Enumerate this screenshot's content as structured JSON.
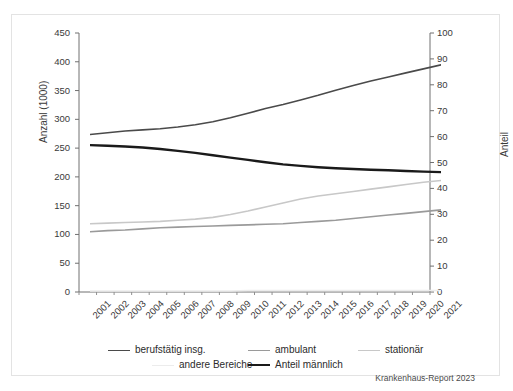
{
  "credit": "Krankenhaus-Report 2023",
  "axes": {
    "left_title": "Anzahl (1000)",
    "right_title": "Anteil",
    "left_ticks": [
      "450",
      "400",
      "350",
      "300",
      "250",
      "200",
      "150",
      "100",
      "50",
      "0"
    ],
    "right_ticks": [
      "100",
      "90",
      "80",
      "70",
      "60",
      "50",
      "40",
      "30",
      "20",
      "10",
      "0"
    ]
  },
  "legend": {
    "rows": [
      [
        {
          "label": "berufstätig insg.",
          "color": "#4a4a4a",
          "width": 1.6
        },
        {
          "label": "ambulant",
          "color": "#9a9a9a",
          "width": 1.6
        },
        {
          "label": "stationär",
          "color": "#c8c8c8",
          "width": 1.6
        }
      ],
      [
        {
          "label": "andere Bereiche",
          "color": "#ececec",
          "width": 1.6
        },
        {
          "label": "Anteil männlich",
          "color": "#1a1a1a",
          "width": 2.4
        }
      ]
    ]
  },
  "chart_data": {
    "type": "line",
    "title": "",
    "xlabel": "",
    "ylabel": "Anzahl (1000)",
    "y2label": "Anteil",
    "ylim": [
      0,
      450
    ],
    "y2lim": [
      0,
      100
    ],
    "grid": false,
    "legend_position": "bottom",
    "categories": [
      "2001",
      "2002",
      "2003",
      "2004",
      "2005",
      "2006",
      "2007",
      "2008",
      "2009",
      "2010",
      "2011",
      "2012",
      "2013",
      "2014",
      "2015",
      "2016",
      "2017",
      "2018",
      "2019",
      "2020",
      "2021"
    ],
    "series": [
      {
        "name": "berufstätig insg.",
        "axis": "left",
        "color": "#4a4a4a",
        "width": 1.6,
        "values": [
          298,
          301,
          304,
          306,
          308,
          311,
          315,
          320,
          327,
          335,
          343,
          350,
          358,
          366,
          375,
          383,
          391,
          398,
          405,
          412,
          419
        ]
      },
      {
        "name": "ambulant",
        "axis": "left",
        "color": "#9a9a9a",
        "width": 1.6,
        "values": [
          129,
          131,
          132,
          134,
          136,
          137,
          138,
          139,
          140,
          141,
          142,
          143,
          145,
          147,
          149,
          152,
          155,
          158,
          161,
          164,
          167
        ]
      },
      {
        "name": "stationär",
        "axis": "left",
        "color": "#c8c8c8",
        "width": 1.6,
        "values": [
          143,
          144,
          145,
          146,
          147,
          149,
          151,
          154,
          159,
          165,
          172,
          179,
          186,
          191,
          195,
          199,
          203,
          207,
          211,
          215,
          218
        ]
      },
      {
        "name": "andere Bereiche",
        "axis": "left",
        "color": "#ececec",
        "width": 1.6,
        "values": [
          26,
          26,
          26,
          26,
          26,
          26,
          26,
          26,
          26,
          27,
          27,
          27,
          27,
          27,
          27,
          27,
          27,
          27,
          27,
          27,
          27
        ]
      },
      {
        "name": "Anteil männlich",
        "axis": "right",
        "color": "#1a1a1a",
        "width": 2.4,
        "values": [
          62.1,
          61.9,
          61.6,
          61.2,
          60.6,
          59.9,
          59.1,
          58.2,
          57.3,
          56.4,
          55.5,
          54.7,
          54.1,
          53.6,
          53.2,
          52.9,
          52.6,
          52.4,
          52.1,
          51.9,
          51.7
        ]
      }
    ]
  }
}
